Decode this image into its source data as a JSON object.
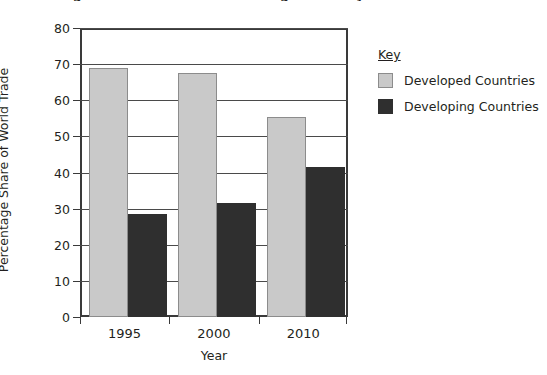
{
  "chart_data": {
    "type": "bar",
    "title": "Figure 1: World Trade Percentage Share by Country Group",
    "xlabel": "Year",
    "ylabel": "Percentage Share of World Trade",
    "categories": [
      "1995",
      "2000",
      "2010"
    ],
    "ylim": [
      0,
      80
    ],
    "yticks": [
      0,
      10,
      20,
      30,
      40,
      50,
      60,
      70,
      80
    ],
    "ytick_labels": [
      "0",
      "10",
      "20",
      "30",
      "40",
      "50",
      "60",
      "70",
      "80"
    ],
    "grid": true,
    "legend_position": "right",
    "legend_title": "Key",
    "series": [
      {
        "name": "Developed Countries",
        "color": "#c9c9c9",
        "border_color": "#8c8c8c",
        "values": [
          69,
          67.5,
          55.5
        ]
      },
      {
        "name": "Developing Countries",
        "color": "#2f2f2f",
        "border_color": "#2f2f2f",
        "values": [
          28.5,
          31.5,
          41.5
        ]
      }
    ]
  },
  "axis": {
    "y_title": "Percentage Share of World Trade",
    "x_title": "Year",
    "y_labels": {
      "t0": "0",
      "t1": "10",
      "t2": "20",
      "t3": "30",
      "t4": "40",
      "t5": "50",
      "t6": "60",
      "t7": "70",
      "t8": "80"
    },
    "x_labels": {
      "c0": "1995",
      "c1": "2000",
      "c2": "2010"
    }
  },
  "legend": {
    "title": "Key",
    "items": [
      {
        "label": "Developed Countries"
      },
      {
        "label": "Developing Countries"
      }
    ]
  },
  "header": {
    "clipped_title": "Figure 1: World Trade Percentage Share by Country Group"
  }
}
